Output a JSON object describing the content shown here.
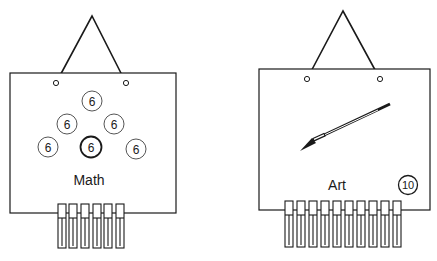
{
  "boards": [
    {
      "name": "math",
      "label": "Math",
      "counters": [
        {
          "value": "6",
          "cx": 92,
          "cy": 101,
          "bold": false
        },
        {
          "value": "6",
          "cx": 67,
          "cy": 124,
          "bold": false
        },
        {
          "value": "6",
          "cx": 114,
          "cy": 124,
          "bold": false
        },
        {
          "value": "6",
          "cx": 48,
          "cy": 147,
          "bold": false
        },
        {
          "value": "6",
          "cx": 91,
          "cy": 147,
          "bold": true
        },
        {
          "value": "6",
          "cx": 136,
          "cy": 149,
          "bold": false
        }
      ],
      "clothespin_count": 6
    },
    {
      "name": "art",
      "label": "Art",
      "badge": "10",
      "icon": "paintbrush-icon",
      "clothespin_count": 10
    }
  ],
  "colors": {
    "ink": "#1a1a1a",
    "paper": "#ffffff"
  }
}
